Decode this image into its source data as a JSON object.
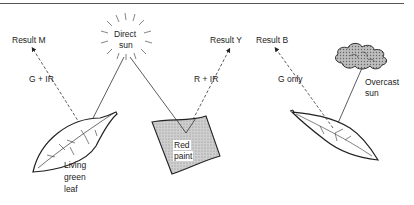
{
  "diagram": {
    "sources": {
      "direct_sun": {
        "line1": "Direct",
        "line2": "sun"
      },
      "overcast_sun": {
        "line1": "Overcast",
        "line2": "sun"
      }
    },
    "objects": {
      "living_leaf": {
        "line1": "Living",
        "line2": "green",
        "line3": "leaf"
      },
      "red_paint": {
        "line1": "Red",
        "line2": "paint"
      }
    },
    "reflections": [
      {
        "label": "G + IR",
        "result": "Result M"
      },
      {
        "label": "R + IR",
        "result": "Result Y"
      },
      {
        "label": "G only",
        "result": "Result B"
      }
    ]
  }
}
